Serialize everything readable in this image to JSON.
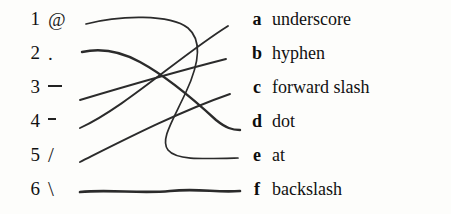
{
  "exercise": {
    "title": "Matching exercise: symbols to names",
    "type": "matching"
  },
  "left_column": {
    "items": [
      {
        "number": "1",
        "symbol": "@",
        "symbol_name": "at-sign",
        "glyph_kind": "at"
      },
      {
        "number": "2",
        "symbol": ".",
        "symbol_name": "period",
        "glyph_kind": "dot"
      },
      {
        "number": "3",
        "symbol": "_",
        "symbol_name": "underscore",
        "glyph_kind": "underscore"
      },
      {
        "number": "4",
        "symbol": "-",
        "symbol_name": "hyphen",
        "glyph_kind": "hyphen"
      },
      {
        "number": "5",
        "symbol": "/",
        "symbol_name": "slash",
        "glyph_kind": "slash"
      },
      {
        "number": "6",
        "symbol": "\\",
        "symbol_name": "backslash",
        "glyph_kind": "backslash"
      }
    ]
  },
  "right_column": {
    "items": [
      {
        "letter": "a",
        "word": "underscore"
      },
      {
        "letter": "b",
        "word": "hyphen"
      },
      {
        "letter": "c",
        "word": "forward slash"
      },
      {
        "letter": "d",
        "word": "dot"
      },
      {
        "letter": "e",
        "word": "at"
      },
      {
        "letter": "f",
        "word": "backslash"
      }
    ]
  },
  "connections": [
    {
      "from": "1",
      "to": "e",
      "style": "curve-loop"
    },
    {
      "from": "2",
      "to": "d",
      "style": "descending"
    },
    {
      "from": "3",
      "to": "b",
      "style": "ascending"
    },
    {
      "from": "4",
      "to": "a",
      "style": "ascending"
    },
    {
      "from": "5",
      "to": "c",
      "style": "ascending"
    },
    {
      "from": "6",
      "to": "f",
      "style": "horizontal"
    }
  ],
  "style": {
    "ink_color": "#2b2b2b",
    "text_color": "#111111",
    "background": "#fdfdfb"
  }
}
